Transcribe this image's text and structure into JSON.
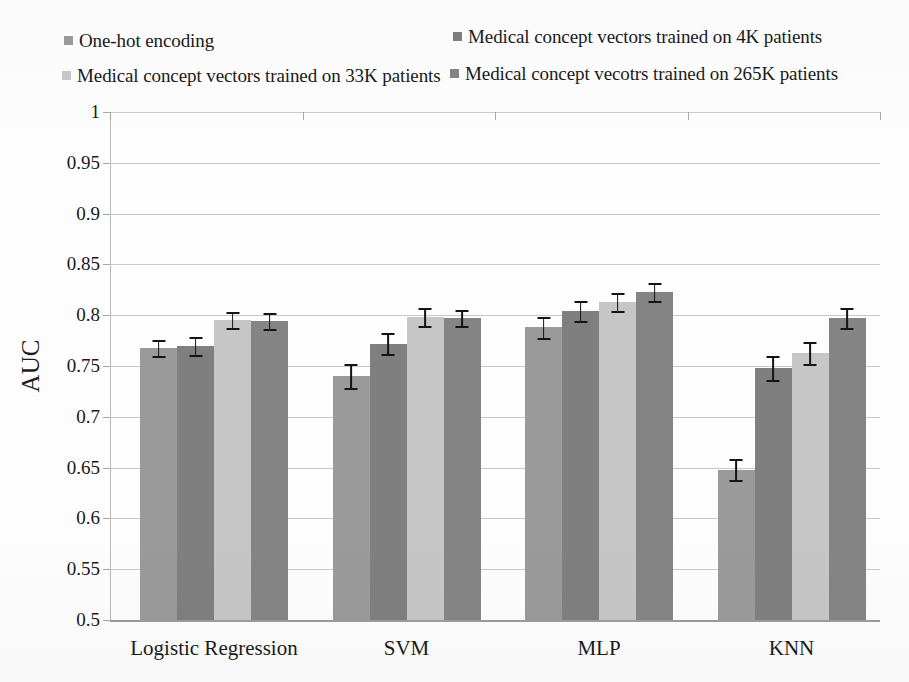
{
  "legend": {
    "items": [
      {
        "label": "One-hot encoding",
        "color": "#9a9a9a",
        "swatch_name": "legend-swatch-one-hot"
      },
      {
        "label": "Medical concept vectors trained on 4K patients",
        "color": "#7f7f7f",
        "swatch_name": "legend-swatch-4k"
      },
      {
        "label": "Medical concept vectors trained on 33K patients",
        "color": "#c6c6c6",
        "swatch_name": "legend-swatch-33k"
      },
      {
        "label": "Medical concept vecotrs trained on 265K patients",
        "color": "#848484",
        "swatch_name": "legend-swatch-265k"
      }
    ]
  },
  "chart_data": {
    "type": "bar",
    "title": "",
    "xlabel": "",
    "ylabel": "AUC",
    "ylim": [
      0.5,
      1
    ],
    "grid": true,
    "legend_position": "top",
    "categories": [
      "Logistic Regression",
      "SVM",
      "MLP",
      "KNN"
    ],
    "ytick_labels": [
      "1",
      "0.95",
      "0.9",
      "0.85",
      "0.8",
      "0.75",
      "0.7",
      "0.65",
      "0.6",
      "0.55",
      "0.5"
    ],
    "yticks": [
      1,
      0.95,
      0.9,
      0.85,
      0.8,
      0.75,
      0.7,
      0.65,
      0.6,
      0.55,
      0.5
    ],
    "series": [
      {
        "name": "One-hot encoding",
        "color": "#9a9a9a",
        "values": [
          0.768,
          0.74,
          0.788,
          0.648
        ],
        "errors": [
          0.008,
          0.012,
          0.01,
          0.01
        ]
      },
      {
        "name": "Medical concept vectors trained on 4K patients",
        "color": "#7f7f7f",
        "values": [
          0.77,
          0.772,
          0.804,
          0.748
        ],
        "errors": [
          0.009,
          0.01,
          0.01,
          0.012
        ]
      },
      {
        "name": "Medical concept vectors trained on 33K patients",
        "color": "#c6c6c6",
        "values": [
          0.795,
          0.798,
          0.813,
          0.763
        ],
        "errors": [
          0.008,
          0.009,
          0.009,
          0.011
        ]
      },
      {
        "name": "Medical concept vecotrs trained on 265K patients",
        "color": "#848484",
        "values": [
          0.794,
          0.797,
          0.823,
          0.797
        ],
        "errors": [
          0.008,
          0.008,
          0.009,
          0.01
        ]
      }
    ]
  }
}
